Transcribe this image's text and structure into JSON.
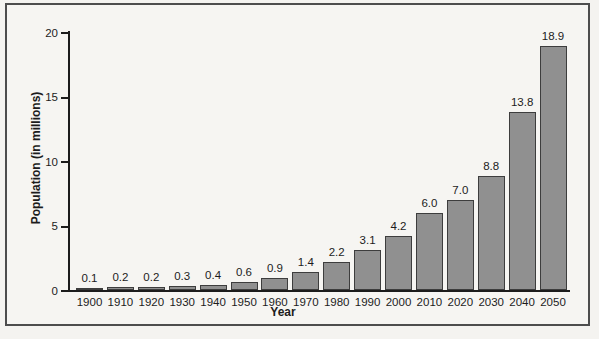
{
  "figure": {
    "background_color": "#f6f5f2",
    "frame_border_color": "#4d4d4d",
    "axis_color": "#1c1c1c",
    "text_color": "#1c1c1c"
  },
  "chart_data": {
    "type": "bar",
    "title": "",
    "xlabel": "Year",
    "ylabel": "Population (in millions)",
    "categories": [
      "1900",
      "1910",
      "1920",
      "1930",
      "1940",
      "1950",
      "1960",
      "1970",
      "1980",
      "1990",
      "2000",
      "2010",
      "2020",
      "2030",
      "2040",
      "2050"
    ],
    "values": [
      0.1,
      0.2,
      0.2,
      0.3,
      0.4,
      0.6,
      0.9,
      1.4,
      2.2,
      3.1,
      4.2,
      6.0,
      7.0,
      8.8,
      13.8,
      18.9
    ],
    "bar_labels": [
      "0.1",
      "0.2",
      "0.2",
      "0.3",
      "0.4",
      "0.6",
      "0.9",
      "1.4",
      "2.2",
      "3.1",
      "4.2",
      "6.0",
      "7.0",
      "8.8",
      "13.8",
      "18.9"
    ],
    "ylim": [
      0,
      20
    ],
    "yticks": [
      0,
      5,
      10,
      15,
      20
    ],
    "ytick_labels": [
      "0",
      "5",
      "10",
      "15",
      "20"
    ],
    "grid": false,
    "legend": null,
    "bar_color": "#909090",
    "bar_border_color": "#3d3d3d"
  }
}
